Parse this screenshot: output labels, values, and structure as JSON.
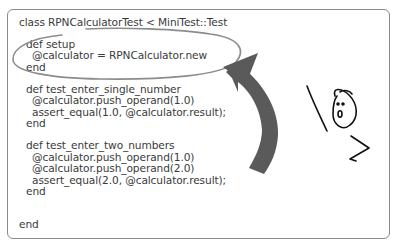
{
  "figure": {
    "code_lines": [
      {
        "text": "class RPNCalculatorTest < MiniTest::Test",
        "indent": 0,
        "y": 16
      },
      {
        "text": "def setup",
        "indent": 1,
        "y": 38
      },
      {
        "text": "@calculator = RPNCalculator.new",
        "indent": 2,
        "y": 49
      },
      {
        "text": "end",
        "indent": 1,
        "y": 61
      },
      {
        "text": "def test_enter_single_number",
        "indent": 1,
        "y": 83
      },
      {
        "text": "@calculator.push_operand(1.0)",
        "indent": 2,
        "y": 94
      },
      {
        "text": "assert_equal(1.0, @calculator.result);",
        "indent": 2,
        "y": 106
      },
      {
        "text": "end",
        "indent": 1,
        "y": 117
      },
      {
        "text": "def test_enter_two_numbers",
        "indent": 1,
        "y": 139
      },
      {
        "text": "@calculator.push_operand(1.0)",
        "indent": 2,
        "y": 151
      },
      {
        "text": "@calculator.push_operand(2.0)",
        "indent": 2,
        "y": 162
      },
      {
        "text": "assert_equal(2.0, @calculator.result);",
        "indent": 2,
        "y": 174
      },
      {
        "text": "end",
        "indent": 1,
        "y": 185
      },
      {
        "text": "end",
        "indent": 0,
        "y": 218
      }
    ],
    "annotations": {
      "highlight": "ellipse-around-setup",
      "arrow": "curved-arrow-pointing-up-left",
      "doodle": "surprised-face-stick-figure"
    },
    "colors": {
      "text": "#3a3a3a",
      "frame": "#8a8a8a",
      "ellipse": "#8c8c8c",
      "arrow": "#5a5a5a",
      "doodle": "#111111"
    }
  }
}
